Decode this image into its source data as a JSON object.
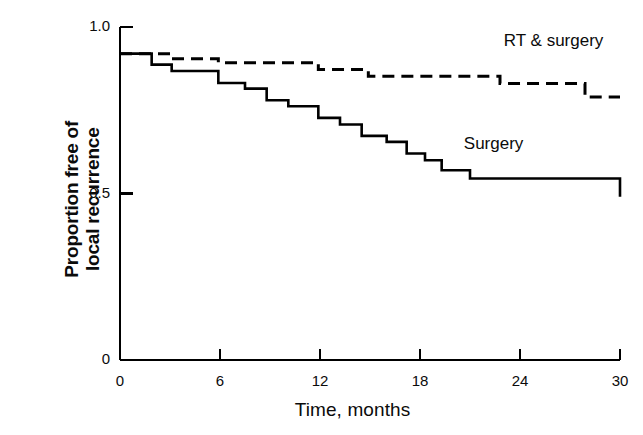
{
  "chart_data": {
    "type": "line",
    "subtype": "kaplan-meier-step",
    "title": "",
    "xlabel": "Time, months",
    "ylabel": "Proportion free of local recurrence",
    "ylabel_lines": [
      "Proportion free of",
      "local recurrence"
    ],
    "xlim": [
      0,
      30
    ],
    "ylim": [
      0,
      1.0
    ],
    "xticks": [
      0,
      6,
      12,
      18,
      24,
      30
    ],
    "xtick_labels": [
      "0",
      "6",
      "12",
      "18",
      "24",
      "30"
    ],
    "yticks": [
      0,
      0.5,
      1.0
    ],
    "ytick_labels": [
      "0",
      "0.5",
      "1.0"
    ],
    "grid": false,
    "legend_position": "inline-annotation",
    "series": [
      {
        "name": "RT & surgery",
        "style": "dashed",
        "color": "#000000",
        "label_x": 29.0,
        "label_y": 0.955,
        "points": [
          {
            "x": 0.0,
            "y": 0.92
          },
          {
            "x": 3.1,
            "y": 0.92
          },
          {
            "x": 3.1,
            "y": 0.905
          },
          {
            "x": 5.9,
            "y": 0.905
          },
          {
            "x": 5.9,
            "y": 0.893
          },
          {
            "x": 11.9,
            "y": 0.893
          },
          {
            "x": 11.9,
            "y": 0.872
          },
          {
            "x": 14.9,
            "y": 0.872
          },
          {
            "x": 14.9,
            "y": 0.852
          },
          {
            "x": 22.8,
            "y": 0.852
          },
          {
            "x": 22.8,
            "y": 0.83
          },
          {
            "x": 27.9,
            "y": 0.83
          },
          {
            "x": 27.9,
            "y": 0.79
          },
          {
            "x": 30.0,
            "y": 0.79
          }
        ]
      },
      {
        "name": "Surgery",
        "style": "solid",
        "color": "#000000",
        "label_x": 24.2,
        "label_y": 0.645,
        "points": [
          {
            "x": 0.0,
            "y": 0.92
          },
          {
            "x": 1.9,
            "y": 0.92
          },
          {
            "x": 1.9,
            "y": 0.887
          },
          {
            "x": 3.1,
            "y": 0.887
          },
          {
            "x": 3.1,
            "y": 0.868
          },
          {
            "x": 5.9,
            "y": 0.868
          },
          {
            "x": 5.9,
            "y": 0.832
          },
          {
            "x": 7.5,
            "y": 0.832
          },
          {
            "x": 7.5,
            "y": 0.815
          },
          {
            "x": 8.8,
            "y": 0.815
          },
          {
            "x": 8.8,
            "y": 0.78
          },
          {
            "x": 10.1,
            "y": 0.78
          },
          {
            "x": 10.1,
            "y": 0.762
          },
          {
            "x": 11.9,
            "y": 0.762
          },
          {
            "x": 11.9,
            "y": 0.727
          },
          {
            "x": 13.2,
            "y": 0.727
          },
          {
            "x": 13.2,
            "y": 0.707
          },
          {
            "x": 14.5,
            "y": 0.707
          },
          {
            "x": 14.5,
            "y": 0.673
          },
          {
            "x": 16.0,
            "y": 0.673
          },
          {
            "x": 16.0,
            "y": 0.655
          },
          {
            "x": 17.2,
            "y": 0.655
          },
          {
            "x": 17.2,
            "y": 0.62
          },
          {
            "x": 18.3,
            "y": 0.62
          },
          {
            "x": 18.3,
            "y": 0.6
          },
          {
            "x": 19.3,
            "y": 0.6
          },
          {
            "x": 19.3,
            "y": 0.57
          },
          {
            "x": 21.0,
            "y": 0.57
          },
          {
            "x": 21.0,
            "y": 0.545
          },
          {
            "x": 30.0,
            "y": 0.545
          },
          {
            "x": 30.0,
            "y": 0.49
          }
        ]
      }
    ],
    "annotations": [
      {
        "text": "RT & surgery",
        "x": 29.0,
        "y": 0.955
      },
      {
        "text": "Surgery",
        "x": 24.2,
        "y": 0.645
      }
    ]
  },
  "axes": {
    "y_title_line1": "Proportion free of",
    "y_title_line2": "local recurrence",
    "x_title": "Time, months"
  }
}
